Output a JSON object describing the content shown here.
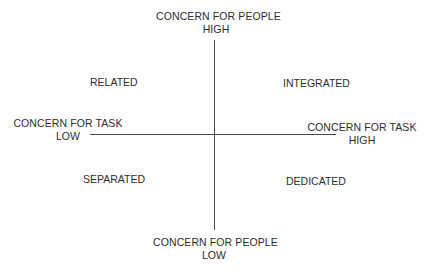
{
  "diagram": {
    "type": "quadrant",
    "axes": {
      "vertical": {
        "name": "CONCERN FOR PEOPLE",
        "high_label": "HIGH",
        "low_label": "LOW"
      },
      "horizontal": {
        "name": "CONCERN FOR TASK",
        "high_label": "HIGH",
        "low_label": "LOW"
      }
    },
    "top": {
      "line1": "CONCERN FOR PEOPLE",
      "line2": "HIGH"
    },
    "bottom": {
      "line1": "CONCERN FOR PEOPLE",
      "line2": "LOW"
    },
    "left": {
      "line1": "CONCERN FOR TASK",
      "line2": "LOW"
    },
    "right": {
      "line1": "CONCERN FOR TASK",
      "line2": "HIGH"
    },
    "quadrants": {
      "top_left": "RELATED",
      "top_right": "INTEGRATED",
      "bottom_left": "SEPARATED",
      "bottom_right": "DEDICATED"
    },
    "colors": {
      "text": "#2e2e2e",
      "lines": "#4a4a4a",
      "background": "#ffffff"
    }
  }
}
